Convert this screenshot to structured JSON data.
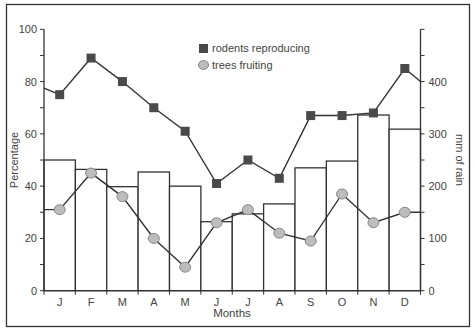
{
  "chart_data": {
    "type": "bar+line",
    "categories": [
      "J",
      "F",
      "M",
      "A",
      "M",
      "J",
      "J",
      "A",
      "S",
      "O",
      "N",
      "D"
    ],
    "xlabel": "Months",
    "ylabel": "Percentage",
    "y2label": "mm of rain",
    "ylim": [
      0,
      100
    ],
    "y2lim": [
      0,
      500
    ],
    "yticks": [
      0,
      20,
      40,
      60,
      80,
      100
    ],
    "yticklabels": [
      "0",
      "20",
      "40",
      "60",
      "80",
      "100"
    ],
    "y2ticks": [
      0,
      100,
      200,
      300,
      400
    ],
    "y2ticklabels": [
      "0",
      "100",
      "200",
      "300",
      "400"
    ],
    "legend_position": "top-center",
    "series": [
      {
        "name": "rainfall",
        "kind": "bar",
        "axis": "right",
        "unit": "mm",
        "values": [
          250,
          232,
          199,
          227,
          200,
          132,
          147,
          166,
          235,
          248,
          336,
          309
        ]
      },
      {
        "name": "rodents reproducing",
        "kind": "line",
        "marker": "square",
        "axis": "left",
        "unit": "%",
        "values": [
          75,
          89,
          80,
          70,
          61,
          41,
          50,
          43,
          67,
          67,
          68,
          85
        ],
        "start_value": 77.5,
        "end_value": 80
      },
      {
        "name": "trees fruiting",
        "kind": "line",
        "marker": "circle",
        "axis": "left",
        "unit": "%",
        "values": [
          31,
          45,
          36,
          20,
          9,
          26,
          31,
          22,
          19,
          37,
          26,
          30
        ],
        "start_value": 31,
        "end_value": 30
      }
    ],
    "colors": {
      "bar_stroke": "#333333",
      "rodent_marker": "#4a4a4a",
      "tree_marker_fill": "#bcbcbc",
      "tree_marker_stroke": "#888888",
      "line": "#333333"
    }
  }
}
